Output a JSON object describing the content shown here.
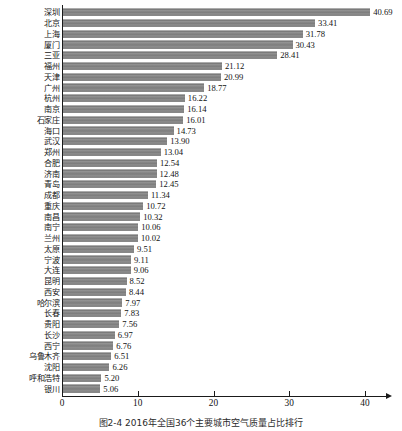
{
  "chart_data": {
    "type": "bar",
    "orientation": "horizontal",
    "title": "",
    "caption": "图2-4   2016年全国36个主要城市空气质量占比排行",
    "xlabel": "",
    "ylabel": "",
    "xlim": [
      0,
      40
    ],
    "xticks": [
      0,
      10,
      20,
      30,
      40
    ],
    "grid": false,
    "legend": null,
    "bar_color": "#8a8a8a",
    "axis_color": "#1a1a1a",
    "categories": [
      "深圳",
      "北京",
      "上海",
      "厦门",
      "三亚",
      "福州",
      "天津",
      "广州",
      "杭州",
      "南京",
      "石家庄",
      "海口",
      "武汉",
      "郑州",
      "合肥",
      "济南",
      "青岛",
      "成都",
      "重庆",
      "南昌",
      "南宁",
      "兰州",
      "太原",
      "宁波",
      "大连",
      "昆明",
      "西安",
      "哈尔滨",
      "长春",
      "贵阳",
      "长沙",
      "西宁",
      "乌鲁木齐",
      "沈阳",
      "呼和浩特",
      "银川"
    ],
    "values": [
      40.69,
      33.41,
      31.78,
      30.43,
      28.41,
      21.12,
      20.99,
      18.77,
      16.22,
      16.14,
      16.01,
      14.73,
      13.9,
      13.04,
      12.54,
      12.48,
      12.45,
      11.34,
      10.72,
      10.32,
      10.06,
      10.02,
      9.51,
      9.11,
      9.06,
      8.52,
      8.44,
      7.97,
      7.83,
      7.56,
      6.97,
      6.76,
      6.51,
      6.26,
      5.2,
      5.06
    ],
    "value_labels": [
      "40.69",
      "33.41",
      "31.78",
      "30.43",
      "28.41",
      "21.12",
      "20.99",
      "18.77",
      "16.22",
      "16.14",
      "16.01",
      "14.73",
      "13.90",
      "13.04",
      "12.54",
      "12.48",
      "12.45",
      "11.34",
      "10.72",
      "10.32",
      "10.06",
      "10.02",
      "9.51",
      "9.11",
      "9.06",
      "8.52",
      "8.44",
      "7.97",
      "7.83",
      "7.56",
      "6.97",
      "6.76",
      "6.51",
      "6.26",
      "5.20",
      "5.06"
    ],
    "xtick_labels": [
      "0",
      "10",
      "20",
      "30",
      "40"
    ]
  }
}
